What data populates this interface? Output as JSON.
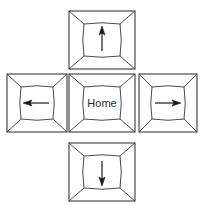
{
  "diagram": {
    "background_color": "#ffffff",
    "line_color": "#3a3a3a",
    "inner_line_color": "#4a4a4a",
    "text_color": "#2b2b2b",
    "layout": "cross",
    "keys": [
      {
        "id": "up",
        "name": "up-arrow-key",
        "label": "",
        "icon": "arrow-up-icon",
        "position": {
          "x": 68,
          "y": 10,
          "width": 68,
          "height": 60
        }
      },
      {
        "id": "left",
        "name": "left-arrow-key",
        "label": "",
        "icon": "arrow-left-icon",
        "position": {
          "x": 6,
          "y": 73,
          "width": 62,
          "height": 60
        }
      },
      {
        "id": "home",
        "name": "home-key",
        "label": "Home",
        "icon": "",
        "position": {
          "x": 68,
          "y": 73,
          "width": 68,
          "height": 60
        }
      },
      {
        "id": "right",
        "name": "right-arrow-key",
        "label": "",
        "icon": "arrow-right-icon",
        "position": {
          "x": 138,
          "y": 73,
          "width": 60,
          "height": 60
        }
      },
      {
        "id": "down",
        "name": "down-arrow-key",
        "label": "",
        "icon": "arrow-down-icon",
        "position": {
          "x": 68,
          "y": 142,
          "width": 68,
          "height": 60
        }
      }
    ]
  }
}
